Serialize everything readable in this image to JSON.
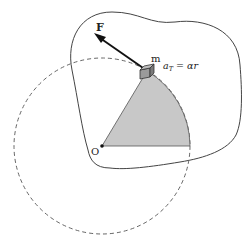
{
  "diagram": {
    "labels": {
      "force": "F",
      "mass": "m",
      "tangential_acceleration_lhs": "a",
      "tangential_acceleration_sub": "T",
      "tangential_acceleration_rhs": " = αr",
      "origin": "O"
    },
    "colors": {
      "stroke": "#444444",
      "dashed_circle": "#666666",
      "sector_fill": "#c8c8c8",
      "block_fill": "#9a9a9a",
      "arrow": "#111111"
    }
  }
}
